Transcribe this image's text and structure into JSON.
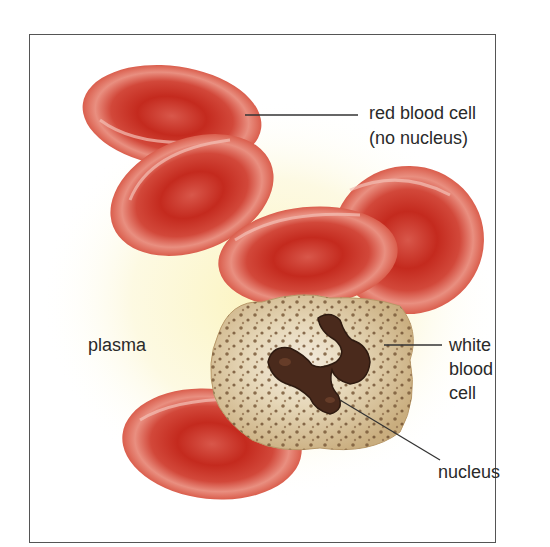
{
  "diagram": {
    "labels": {
      "red_blood_cell_line1": "red blood cell",
      "red_blood_cell_line2": "(no nucleus)",
      "plasma": "plasma",
      "white_blood_cell_line1": "white",
      "white_blood_cell_line2": "blood",
      "white_blood_cell_line3": "cell",
      "nucleus": "nucleus"
    },
    "colors": {
      "frame_border": "#555555",
      "plasma_glow": "#fbf6c8",
      "rbc_rim": "#d9574a",
      "rbc_center": "#c42a1e",
      "rbc_highlight": "#f2b3a6",
      "wbc_cytoplasm": "#d8c39a",
      "wbc_granule": "#7a5a3a",
      "wbc_nucleus": "#4a2a1c",
      "leader_line": "#333333",
      "text": "#2a2a2a"
    }
  }
}
